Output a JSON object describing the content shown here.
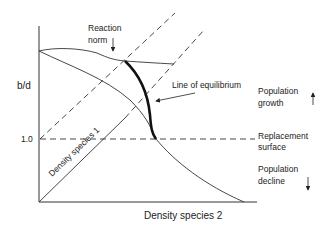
{
  "diagram": {
    "y_axis_label": "b/d",
    "y_tick_label": "1.0",
    "x_axis_label": "Density species 2",
    "diagonal_label": "Density species 1",
    "reaction_norm_label_line1": "Reaction",
    "reaction_norm_label_line2": "norm",
    "equilibrium_label": "Line of equilibrium",
    "replacement_label_line1": "Replacement",
    "replacement_label_line2": "surface",
    "growth_label_line1": "Population",
    "growth_label_line2": "growth",
    "decline_label_line1": "Population",
    "decline_label_line2": "decline",
    "colors": {
      "line": "#333333",
      "text": "#222222"
    }
  }
}
